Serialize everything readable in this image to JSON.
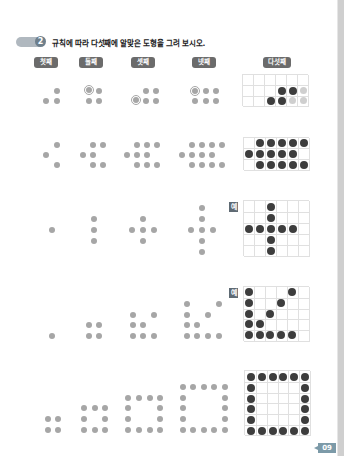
{
  "question": {
    "number": "2",
    "text": "규칙에 따라 다섯째에 알맞은 도형을 그려 보시오."
  },
  "columns": [
    "첫째",
    "둘째",
    "셋째",
    "넷째",
    "다섯째"
  ],
  "example_label": "예",
  "page_number": "09",
  "rows": [
    {
      "name": "row-1-growing-block",
      "has_example": false
    },
    {
      "name": "row-2-growing-arrow",
      "has_example": false
    },
    {
      "name": "row-3-growing-cross",
      "has_example": true
    },
    {
      "name": "row-4-growing-staircase",
      "has_example": true
    },
    {
      "name": "row-5-growing-square-frame",
      "has_example": false
    }
  ]
}
